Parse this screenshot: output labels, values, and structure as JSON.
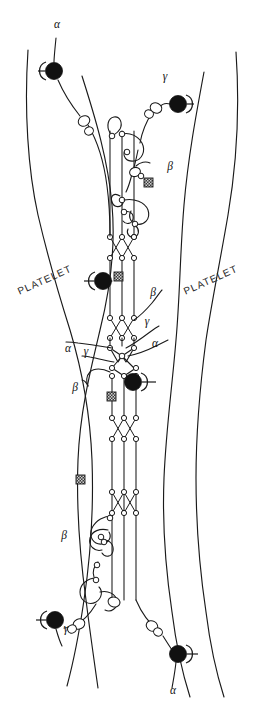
{
  "figure": {
    "background_color": "#ffffff",
    "line_color": "#1a1a1a",
    "receptor_color": "#111111",
    "width": 259,
    "height": 709
  },
  "platelet_labels": [
    {
      "id": "platelet-left",
      "text": "PLATELET",
      "x": 46,
      "y": 283,
      "rotation": -24
    },
    {
      "id": "platelet-right",
      "text": "PLATELET",
      "x": 212,
      "y": 283,
      "rotation": -24
    }
  ],
  "chain_labels": [
    {
      "id": "alpha-top-left",
      "text": "α",
      "x": 57,
      "y": 28
    },
    {
      "id": "gamma-top-right",
      "text": "γ",
      "x": 165,
      "y": 80
    },
    {
      "id": "beta-upper-right",
      "text": "β",
      "x": 170,
      "y": 170
    },
    {
      "id": "beta-center-right",
      "text": "β",
      "x": 153,
      "y": 296
    },
    {
      "id": "gamma-center-right",
      "text": "γ",
      "x": 147,
      "y": 325
    },
    {
      "id": "alpha-center-right",
      "text": "α",
      "x": 155,
      "y": 347
    },
    {
      "id": "alpha-center-left",
      "text": "α",
      "x": 68,
      "y": 352
    },
    {
      "id": "gamma-center-left",
      "text": "γ",
      "x": 86,
      "y": 355
    },
    {
      "id": "beta-center-left",
      "text": "β",
      "x": 75,
      "y": 391
    },
    {
      "id": "beta-lower-left",
      "text": "β",
      "x": 64,
      "y": 539
    },
    {
      "id": "gamma-bottom-left",
      "text": "γ",
      "x": 66,
      "y": 632
    },
    {
      "id": "alpha-bottom-right",
      "text": "α",
      "x": 173,
      "y": 694
    }
  ],
  "receptors": [
    {
      "id": "receptor-top-left",
      "cx": 54,
      "cy": 71,
      "r": 8.5,
      "cup_side": "left"
    },
    {
      "id": "receptor-top-right",
      "cx": 178,
      "cy": 104,
      "r": 8.5,
      "cup_side": "right"
    },
    {
      "id": "receptor-mid-left",
      "cx": 103,
      "cy": 281,
      "r": 8.5,
      "cup_side": "left"
    },
    {
      "id": "receptor-mid-right",
      "cx": 133,
      "cy": 382,
      "r": 8.5,
      "cup_side": "right"
    },
    {
      "id": "receptor-bottom-left",
      "cx": 55,
      "cy": 620,
      "r": 8.5,
      "cup_side": "left"
    },
    {
      "id": "receptor-bottom-right",
      "cx": 178,
      "cy": 654,
      "r": 8.5,
      "cup_side": "right"
    }
  ],
  "crosslinks": [
    {
      "id": "crosslink-upper",
      "x": 144,
      "y": 178,
      "size": 9
    },
    {
      "id": "crosslink-mid",
      "x": 114,
      "y": 272,
      "size": 9
    },
    {
      "id": "crosslink-lower",
      "x": 107,
      "y": 392,
      "size": 9
    },
    {
      "id": "crosslink-bottom",
      "x": 76,
      "y": 475,
      "size": 9
    }
  ],
  "structures": {
    "central_strand_count": 3,
    "braid_regions": 4,
    "description": "Three parallel polypeptide strands form the fibrin coiled-coil core with four braided crossover regions and a central D-domain junction."
  },
  "legend_note": "Black circles mark platelet membrane receptors; hatched squares mark covalent crosslinks."
}
